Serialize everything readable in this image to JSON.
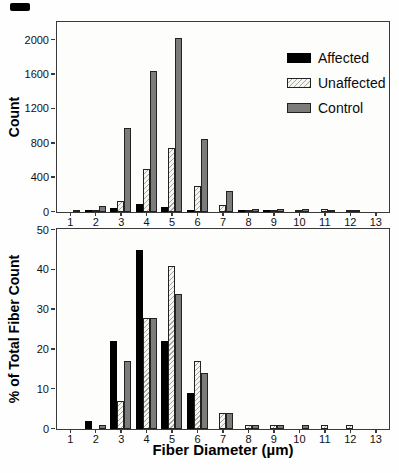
{
  "colors": {
    "affected": "#000000",
    "unaffected_fill": "#f5f5f2",
    "unaffected_hatch": "#a6a6a0",
    "control": "#7c7c7c",
    "axis": "#3a3a3a"
  },
  "chart_data": [
    {
      "type": "bar",
      "title": "",
      "xlabel": "",
      "ylabel": "Count",
      "ylim": [
        0,
        2200
      ],
      "yticks": [
        0,
        400,
        800,
        1200,
        1600,
        2000
      ],
      "grid": false,
      "categories": [
        "1",
        "2",
        "3",
        "4",
        "5",
        "6",
        "7",
        "8",
        "9",
        "10",
        "11",
        "12",
        "13"
      ],
      "legend": {
        "position": "top-right",
        "entries": [
          "Affected",
          "Unaffected",
          "Control"
        ]
      },
      "series": [
        {
          "name": "Affected",
          "values": [
            0,
            10,
            50,
            95,
            55,
            25,
            0,
            5,
            5,
            0,
            0,
            0,
            0
          ]
        },
        {
          "name": "Unaffected",
          "values": [
            0,
            5,
            130,
            500,
            740,
            300,
            80,
            15,
            15,
            5,
            30,
            5,
            0
          ]
        },
        {
          "name": "Control",
          "values": [
            5,
            70,
            980,
            1640,
            2030,
            850,
            240,
            40,
            40,
            40,
            10,
            20,
            0
          ]
        }
      ]
    },
    {
      "type": "bar",
      "title": "",
      "xlabel": "Fiber Diameter (µm)",
      "ylabel": "% of Total Fiber Count",
      "ylim": [
        0,
        50
      ],
      "yticks": [
        0,
        10,
        20,
        30,
        40,
        50
      ],
      "grid": false,
      "categories": [
        "1",
        "2",
        "3",
        "4",
        "5",
        "6",
        "7",
        "8",
        "9",
        "10",
        "11",
        "12",
        "13"
      ],
      "series": [
        {
          "name": "Affected",
          "values": [
            0,
            2,
            22,
            45,
            22,
            9,
            0,
            0,
            0,
            0,
            0,
            0,
            0
          ]
        },
        {
          "name": "Unaffected",
          "values": [
            0,
            0,
            7,
            28,
            41,
            17,
            4,
            1,
            1,
            0,
            1,
            1,
            0
          ]
        },
        {
          "name": "Control",
          "values": [
            0,
            1,
            17,
            28,
            34,
            14,
            4,
            1,
            1,
            1,
            0,
            0,
            0
          ]
        }
      ]
    }
  ]
}
